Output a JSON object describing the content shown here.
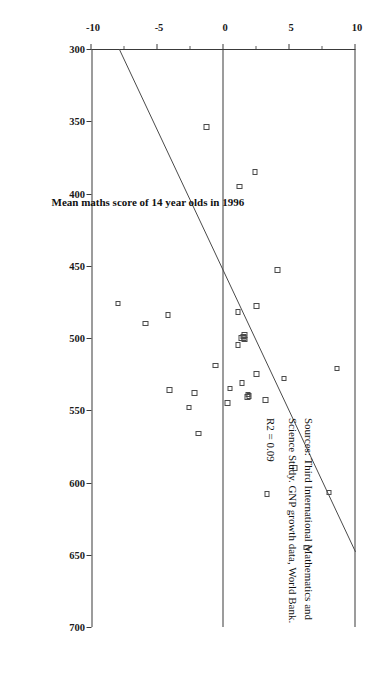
{
  "chart_data": {
    "type": "scatter",
    "title": "",
    "xlabel": "Mean maths score of 14 year olds in 1996",
    "ylabel": "Growth in per capita GNP 1985-94",
    "xlim": [
      300,
      700
    ],
    "ylim": [
      -10,
      10
    ],
    "xticks": [
      300,
      350,
      400,
      450,
      500,
      550,
      600,
      650,
      700
    ],
    "yticks": [
      10,
      5,
      0,
      -5,
      -10
    ],
    "xtick_labels": [
      "300",
      "350",
      "400",
      "450",
      "500",
      "550",
      "600",
      "650",
      "700"
    ],
    "ytick_labels": [
      "10",
      "5",
      "0",
      "-5",
      "-10"
    ],
    "grid": false,
    "legend": "none",
    "orientation": "rotated-90-clockwise",
    "r_squared_label": "R2 = 0.09",
    "r_squared": 0.09,
    "trendline": {
      "type": "linear",
      "x_start": 300,
      "y_start": -7.9,
      "x_end": 648,
      "y_end": 10.0
    },
    "zero_reference_line": 0,
    "points": [
      {
        "x": 354,
        "y": -1.3
      },
      {
        "x": 385,
        "y": 2.4
      },
      {
        "x": 395,
        "y": 1.2
      },
      {
        "x": 453,
        "y": 4.1
      },
      {
        "x": 478,
        "y": 2.5
      },
      {
        "x": 482,
        "y": 1.1
      },
      {
        "x": 484,
        "y": -4.2
      },
      {
        "x": 490,
        "y": -5.9
      },
      {
        "x": 476,
        "y": -8.0
      },
      {
        "x": 498,
        "y": 1.6
      },
      {
        "x": 499,
        "y": 1.5
      },
      {
        "x": 500,
        "y": 1.55
      },
      {
        "x": 500,
        "y": 1.35
      },
      {
        "x": 501,
        "y": 1.6
      },
      {
        "x": 505,
        "y": 1.1
      },
      {
        "x": 519,
        "y": -0.6
      },
      {
        "x": 521,
        "y": 8.6
      },
      {
        "x": 525,
        "y": 2.5
      },
      {
        "x": 528,
        "y": 4.6
      },
      {
        "x": 531,
        "y": 1.4
      },
      {
        "x": 535,
        "y": 0.5
      },
      {
        "x": 536,
        "y": -4.1
      },
      {
        "x": 538,
        "y": -2.2
      },
      {
        "x": 539,
        "y": 1.85
      },
      {
        "x": 540,
        "y": 1.95
      },
      {
        "x": 541,
        "y": 1.8
      },
      {
        "x": 543,
        "y": 3.2
      },
      {
        "x": 545,
        "y": 0.3
      },
      {
        "x": 548,
        "y": -2.6
      },
      {
        "x": 566,
        "y": -1.9
      },
      {
        "x": 590,
        "y": 5.4
      },
      {
        "x": 607,
        "y": 8.0
      },
      {
        "x": 608,
        "y": 3.3
      },
      {
        "x": 645,
        "y": 6.3
      }
    ]
  },
  "axes": {
    "x_title": "Mean maths score of 14 year olds in 1996",
    "y_title": "Growth in per capita GNP 1985-94"
  },
  "source_note": {
    "line1": "Sources: Third International Mathematics and",
    "line2": "Science Study.  GNP growth data, World Bank.",
    "line3": "R2 = 0.09"
  },
  "colors": {
    "axis": "#3a3a3a",
    "marker_stroke": "#4a4a4a",
    "trendline": "#4a4a4a",
    "text": "#111111",
    "background": "#ffffff"
  }
}
